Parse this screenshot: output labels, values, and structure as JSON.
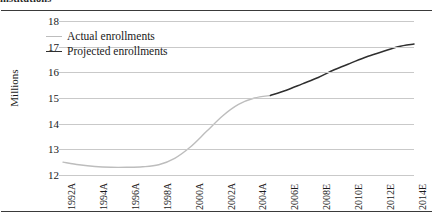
{
  "caption": {
    "cutoff_text": "institutions"
  },
  "chart_data": {
    "type": "line",
    "title": "",
    "xlabel": "",
    "ylabel": "Millions",
    "ylim": [
      12,
      18
    ],
    "yticks": [
      18,
      17,
      16,
      15,
      14,
      13,
      12
    ],
    "grid": true,
    "legend_position": "top-left",
    "categories": [
      "1992A",
      "1993A",
      "1994A",
      "1995A",
      "1996A",
      "1997A",
      "1998A",
      "1999A",
      "2000A",
      "2001A",
      "2002A",
      "2003A",
      "2004A",
      "2005E",
      "2006E",
      "2007E",
      "2008E",
      "2009E",
      "2010E",
      "2011E",
      "2012E",
      "2013E",
      "2014E"
    ],
    "xtick_labels": [
      "1992A",
      "1994A",
      "1996A",
      "1998A",
      "2000A",
      "2002A",
      "2004A",
      "2006E",
      "2008E",
      "2010E",
      "2012E",
      "2014E"
    ],
    "series": [
      {
        "name": "Actual enrollments",
        "color": "#bdbdbd",
        "x": [
          "1992A",
          "1993A",
          "1994A",
          "1995A",
          "1996A",
          "1997A",
          "1998A",
          "1999A",
          "2000A",
          "2001A",
          "2002A",
          "2003A",
          "2004A",
          "2005E"
        ],
        "values": [
          12.5,
          12.4,
          12.33,
          12.3,
          12.3,
          12.32,
          12.4,
          12.65,
          13.1,
          13.7,
          14.3,
          14.75,
          15.0,
          15.1
        ]
      },
      {
        "name": "Projected enrollments",
        "color": "#2f2f2f",
        "x": [
          "2005E",
          "2006E",
          "2007E",
          "2008E",
          "2009E",
          "2010E",
          "2011E",
          "2012E",
          "2013E",
          "2014E"
        ],
        "values": [
          15.1,
          15.3,
          15.55,
          15.8,
          16.1,
          16.35,
          16.6,
          16.8,
          17.0,
          17.1
        ]
      }
    ]
  },
  "legend": {
    "items": [
      {
        "label": "Actual enrollments",
        "color": "#bdbdbd"
      },
      {
        "label": "Projected enrollments",
        "color": "#2f2f2f"
      }
    ]
  }
}
